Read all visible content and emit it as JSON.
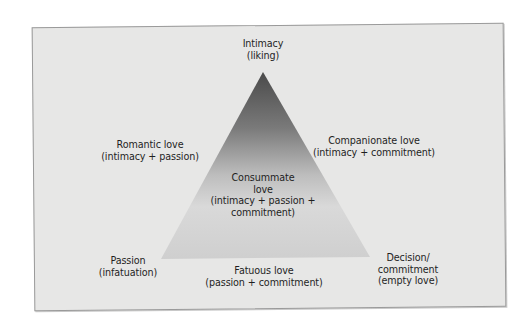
{
  "diagram": {
    "colors": {
      "panel_background": "#e7e7e6",
      "panel_border": "#9a9a9a",
      "triangle_dark": "#3a3a3a",
      "triangle_light": "#d8d8d8",
      "text": "#1f1f1f"
    },
    "vertices": {
      "top": {
        "lines": [
          "Intimacy",
          "(liking)"
        ]
      },
      "bottom_left": {
        "lines": [
          "Passion",
          "(infatuation)"
        ]
      },
      "bottom_right": {
        "lines": [
          "Decision/",
          "commitment",
          "(empty love)"
        ]
      }
    },
    "edges": {
      "left": {
        "lines": [
          "Romantic love",
          "(intimacy + passion)"
        ]
      },
      "right": {
        "lines": [
          "Companionate love",
          "(intimacy + commitment)"
        ]
      },
      "bottom": {
        "lines": [
          "Fatuous love",
          "(passion + commitment)"
        ]
      }
    },
    "center": {
      "lines": [
        "Consummate",
        "love",
        "(intimacy + passion +",
        "commitment)"
      ]
    }
  }
}
